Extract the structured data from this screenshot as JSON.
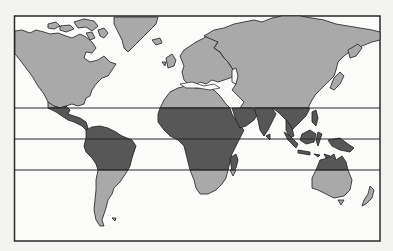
{
  "map": {
    "title": "",
    "type": "world-map",
    "projection": "Mercator-like",
    "legend": [],
    "regions": {
      "tropical": {
        "label": "Tropical zone",
        "color": "#575757",
        "areas": [
          "Central America",
          "Northern South America",
          "Central Africa",
          "Arabian Peninsula (south)",
          "India",
          "Southeast Asia",
          "Indonesia",
          "New Guinea",
          "Northern Australia",
          "Madagascar"
        ]
      },
      "non_tropical": {
        "label": "Other land",
        "color": "#a9a9a9",
        "areas": [
          "North America",
          "Greenland",
          "Europe",
          "Asia",
          "Southern South America",
          "North Africa",
          "Southern Africa",
          "Southern Australia",
          "New Zealand"
        ]
      }
    },
    "latitude_lines": [
      {
        "name": "Tropic of Cancer",
        "y": 108
      },
      {
        "name": "Equator",
        "y": 139
      },
      {
        "name": "Tropic of Capricorn",
        "y": 170
      }
    ],
    "colors": {
      "background": "#f3f3f1",
      "ocean": "#fbfbfa",
      "frame": "#2a2a2a"
    }
  }
}
